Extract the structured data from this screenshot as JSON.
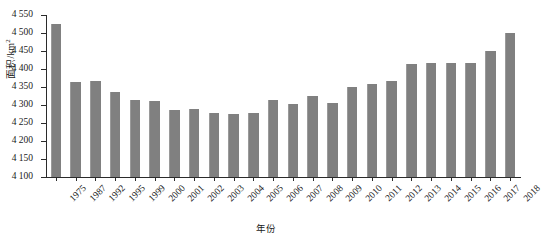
{
  "chart_data": {
    "type": "bar",
    "title": "",
    "subtitle": "",
    "xlabel": "年份",
    "ylabel": "面积/km²",
    "ylabel_base": "面积/km",
    "ylabel_sup": "2",
    "ylim": [
      4100,
      4550
    ],
    "ytick_step": 50,
    "ytick_labels": [
      "4 550",
      "4 500",
      "4 450",
      "4 400",
      "4 350",
      "4 300",
      "4 250",
      "4 200",
      "4 150",
      "4 100"
    ],
    "ytick_values": [
      4550,
      4500,
      4450,
      4400,
      4350,
      4300,
      4250,
      4200,
      4150,
      4100
    ],
    "grid": false,
    "legend": null,
    "bar_color": "#808080",
    "axis_color": "#2b2b2b",
    "background": "#ffffff",
    "categories": [
      "1975",
      "1987",
      "1992",
      "1995",
      "1999",
      "2000",
      "2001",
      "2002",
      "2003",
      "2004",
      "2005",
      "2006",
      "2007",
      "2008",
      "2009",
      "2010",
      "2011",
      "2012",
      "2013",
      "2014",
      "2015",
      "2016",
      "2017",
      "2018"
    ],
    "values": [
      4525,
      4363,
      4367,
      4335,
      4313,
      4311,
      4287,
      4290,
      4277,
      4275,
      4277,
      4313,
      4303,
      4324,
      4305,
      4350,
      4357,
      4368,
      4415,
      4418,
      4418,
      4418,
      4450,
      4500
    ],
    "series": [
      {
        "name": "面积",
        "values": [
          4525,
          4363,
          4367,
          4335,
          4313,
          4311,
          4287,
          4290,
          4277,
          4275,
          4277,
          4313,
          4303,
          4324,
          4305,
          4350,
          4357,
          4368,
          4415,
          4418,
          4418,
          4418,
          4450,
          4500
        ]
      }
    ]
  }
}
